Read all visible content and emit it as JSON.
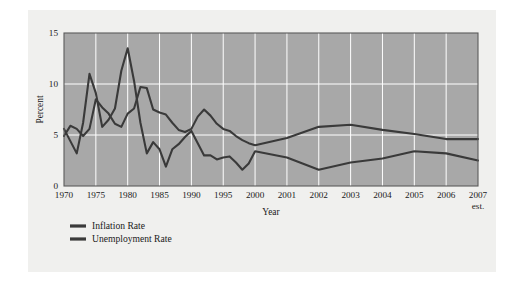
{
  "figure": {
    "background_color": "#f0f0ee",
    "page_color": "#ffffff"
  },
  "chart_data": {
    "type": "line",
    "title": "",
    "xlabel": "Year",
    "ylabel": "Percent",
    "ylim": [
      0,
      15
    ],
    "yticks": [
      0,
      5,
      10,
      15
    ],
    "ytick_labels": [
      "0",
      "5",
      "10",
      "15"
    ],
    "grid": true,
    "grid_color": "#ffffff",
    "plot_background": "#a8a8a8",
    "legend_position": "below-left",
    "x_axis_note": "est.",
    "x_axis_note_under": "2007",
    "xtick_labels": [
      "1970",
      "1975",
      "1980",
      "1985",
      "1990",
      "1995",
      "2000",
      "2001",
      "2002",
      "2003",
      "2004",
      "2005",
      "2006",
      "2007"
    ],
    "x": [
      1970,
      1971,
      1972,
      1973,
      1974,
      1975,
      1976,
      1977,
      1978,
      1979,
      1980,
      1981,
      1982,
      1983,
      1984,
      1985,
      1986,
      1987,
      1988,
      1989,
      1990,
      1991,
      1992,
      1993,
      1994,
      1995,
      1996,
      1997,
      1998,
      1999,
      2000,
      2001,
      2002,
      2003,
      2004,
      2005,
      2006,
      2007
    ],
    "series": [
      {
        "name": "Inflation Rate",
        "color": "#3a3a3a",
        "values": [
          5.6,
          4.4,
          3.2,
          6.2,
          11.0,
          9.1,
          5.8,
          6.5,
          7.6,
          11.3,
          13.5,
          10.3,
          6.2,
          3.2,
          4.3,
          3.6,
          1.9,
          3.6,
          4.1,
          4.8,
          5.4,
          4.2,
          3.0,
          3.0,
          2.6,
          2.8,
          2.9,
          2.3,
          1.6,
          2.2,
          3.4,
          2.8,
          1.6,
          2.3,
          2.7,
          3.4,
          3.2,
          2.5
        ]
      },
      {
        "name": "Unemployment Rate",
        "color": "#3a3a3a",
        "values": [
          4.9,
          5.9,
          5.6,
          4.9,
          5.6,
          8.5,
          7.7,
          7.1,
          6.1,
          5.8,
          7.1,
          7.6,
          9.7,
          9.6,
          7.5,
          7.2,
          7.0,
          6.2,
          5.5,
          5.3,
          5.6,
          6.8,
          7.5,
          6.9,
          6.1,
          5.6,
          5.4,
          4.9,
          4.5,
          4.2,
          4.0,
          4.7,
          5.8,
          6.0,
          5.5,
          5.1,
          4.6,
          4.6
        ]
      }
    ]
  },
  "legend": {
    "items": [
      {
        "label": "Inflation Rate"
      },
      {
        "label": "Unemployment Rate"
      }
    ]
  }
}
